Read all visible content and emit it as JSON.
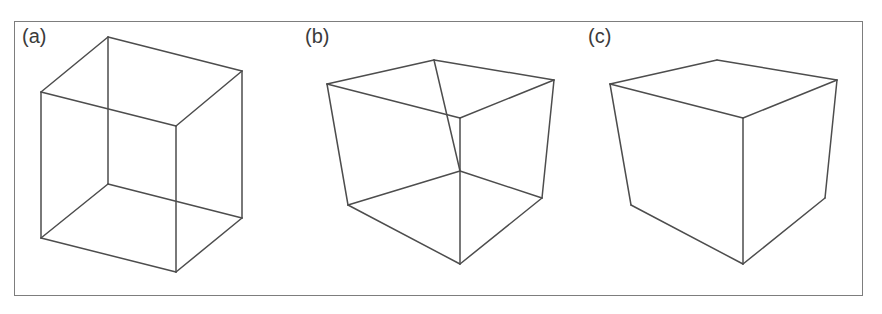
{
  "figure": {
    "background_color": "#ffffff",
    "frame_color": "#7d7d7d",
    "line_color": "#4d4d4d",
    "panels": [
      {
        "id": "a",
        "label": "(a)",
        "description": "transparent wireframe cube, all twelve edges visible (Necker cube), orthographic-like projection",
        "hidden_lines": "visible",
        "vertices": {
          "top_back": [
            93,
            15
          ],
          "top_left": [
            26,
            70
          ],
          "top_right": [
            227,
            49
          ],
          "top_front": [
            161,
            104
          ],
          "bottom_back": [
            93,
            162
          ],
          "bottom_left": [
            26,
            216
          ],
          "bottom_right": [
            227,
            196
          ],
          "bottom_front": [
            161,
            250
          ]
        },
        "edges": [
          [
            "top_back",
            "top_left"
          ],
          [
            "top_back",
            "top_right"
          ],
          [
            "top_left",
            "top_front"
          ],
          [
            "top_right",
            "top_front"
          ],
          [
            "bottom_back",
            "bottom_left"
          ],
          [
            "bottom_back",
            "bottom_right"
          ],
          [
            "bottom_left",
            "bottom_front"
          ],
          [
            "bottom_right",
            "bottom_front"
          ],
          [
            "top_back",
            "bottom_back"
          ],
          [
            "top_left",
            "bottom_left"
          ],
          [
            "top_right",
            "bottom_right"
          ],
          [
            "top_front",
            "bottom_front"
          ]
        ]
      },
      {
        "id": "b",
        "label": "(b)",
        "description": "transparent wireframe cube drawn in perspective, all twelve edges visible",
        "hidden_lines": "visible",
        "vertices": {
          "top_back": [
            136,
            38
          ],
          "top_left": [
            29,
            62
          ],
          "top_right": [
            256,
            58
          ],
          "top_front": [
            162,
            96
          ],
          "bottom_back": [
            162,
            149
          ],
          "bottom_left": [
            50,
            183
          ],
          "bottom_right": [
            244,
            176
          ],
          "bottom_front": [
            162,
            242
          ]
        },
        "edges": [
          [
            "top_back",
            "top_left"
          ],
          [
            "top_back",
            "top_right"
          ],
          [
            "top_left",
            "top_front"
          ],
          [
            "top_right",
            "top_front"
          ],
          [
            "bottom_back",
            "bottom_left"
          ],
          [
            "bottom_back",
            "bottom_right"
          ],
          [
            "bottom_left",
            "bottom_front"
          ],
          [
            "bottom_right",
            "bottom_front"
          ],
          [
            "top_back",
            "bottom_back"
          ],
          [
            "top_left",
            "bottom_left"
          ],
          [
            "top_right",
            "bottom_right"
          ],
          [
            "top_front",
            "bottom_front"
          ]
        ]
      },
      {
        "id": "c",
        "label": "(c)",
        "description": "opaque solid cube in perspective, hidden lines removed, nine edges visible",
        "hidden_lines": "removed",
        "vertices": {
          "top_back": [
            136,
            38
          ],
          "top_left": [
            29,
            62
          ],
          "top_right": [
            256,
            58
          ],
          "top_front": [
            162,
            96
          ],
          "bottom_left": [
            50,
            183
          ],
          "bottom_right": [
            244,
            176
          ],
          "bottom_front": [
            162,
            242
          ]
        },
        "edges": [
          [
            "top_back",
            "top_left"
          ],
          [
            "top_back",
            "top_right"
          ],
          [
            "top_left",
            "top_front"
          ],
          [
            "top_right",
            "top_front"
          ],
          [
            "top_left",
            "bottom_left"
          ],
          [
            "top_right",
            "bottom_right"
          ],
          [
            "top_front",
            "bottom_front"
          ],
          [
            "bottom_left",
            "bottom_front"
          ],
          [
            "bottom_right",
            "bottom_front"
          ]
        ]
      }
    ]
  }
}
